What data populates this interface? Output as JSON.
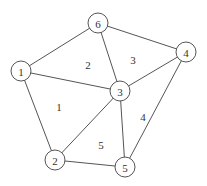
{
  "diagram": {
    "type": "triangulated-mesh-graph",
    "width": 207,
    "height": 186,
    "stroke_color": "#555555",
    "node_radius": 10,
    "nodes": [
      {
        "id": "1",
        "label": "1",
        "x": 21,
        "y": 71
      },
      {
        "id": "2",
        "label": "2",
        "x": 55,
        "y": 160
      },
      {
        "id": "3",
        "label": "3",
        "x": 120,
        "y": 91
      },
      {
        "id": "4",
        "label": "4",
        "x": 186,
        "y": 52
      },
      {
        "id": "5",
        "label": "5",
        "x": 125,
        "y": 167
      },
      {
        "id": "6",
        "label": "6",
        "x": 98,
        "y": 23
      }
    ],
    "edges": [
      {
        "from": "1",
        "to": "6"
      },
      {
        "from": "1",
        "to": "3"
      },
      {
        "from": "1",
        "to": "2"
      },
      {
        "from": "6",
        "to": "3"
      },
      {
        "from": "6",
        "to": "4"
      },
      {
        "from": "3",
        "to": "4"
      },
      {
        "from": "3",
        "to": "2"
      },
      {
        "from": "3",
        "to": "5"
      },
      {
        "from": "4",
        "to": "5"
      },
      {
        "from": "2",
        "to": "5"
      }
    ],
    "regions": [
      {
        "label": "1",
        "x": 59,
        "y": 107
      },
      {
        "label": "2",
        "x": 88,
        "y": 65
      },
      {
        "label": "3",
        "x": 133,
        "y": 60
      },
      {
        "label": "4",
        "x": 143,
        "y": 117
      },
      {
        "label": "5",
        "x": 101,
        "y": 145
      }
    ]
  }
}
